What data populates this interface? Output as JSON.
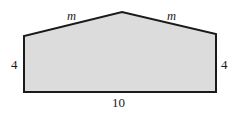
{
  "figure": {
    "name": "pentagon-house-shape",
    "shape_type": "pentagon",
    "fill_color": "#dcdcdc",
    "stroke_color": "#1a1a1a",
    "stroke_width": 2,
    "background_color": "#ffffff",
    "vertices": [
      {
        "name": "bottom-left",
        "x": 24,
        "y": 92
      },
      {
        "name": "top-left",
        "x": 24,
        "y": 36
      },
      {
        "name": "apex",
        "x": 122,
        "y": 12
      },
      {
        "name": "top-right",
        "x": 216,
        "y": 34
      },
      {
        "name": "bottom-right",
        "x": 216,
        "y": 92
      }
    ],
    "polygon_points": "24,92 24,36 122,12 216,34 216,92",
    "labels": {
      "slant_left": "m",
      "slant_right": "m",
      "side_left": "4",
      "side_right": "4",
      "base": "10"
    }
  }
}
